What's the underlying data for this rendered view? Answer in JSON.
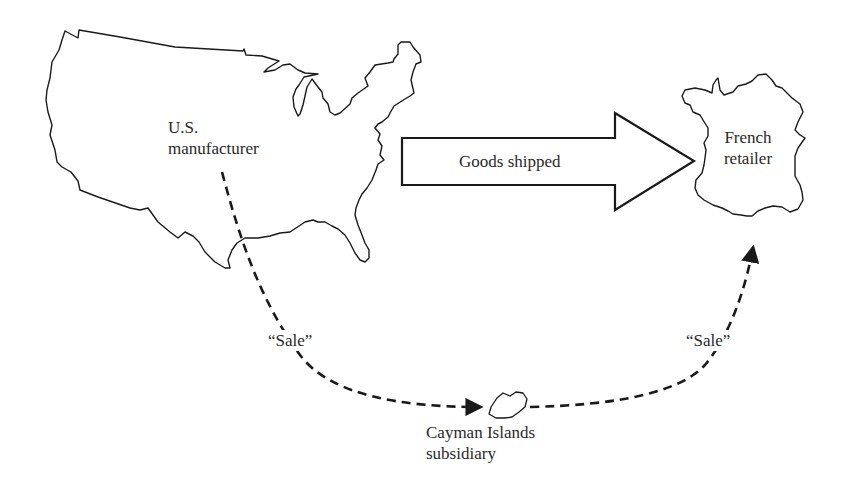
{
  "diagram": {
    "type": "flow",
    "nodes": [
      {
        "id": "us",
        "shape": "usa-map-outline",
        "label_lines": [
          "U.S.",
          "manufacturer"
        ]
      },
      {
        "id": "fr",
        "shape": "france-map-outline",
        "label_lines": [
          "French",
          "retailer"
        ]
      },
      {
        "id": "ky",
        "shape": "cayman-island-outline",
        "label_lines": [
          "Cayman Islands",
          "subsidiary"
        ]
      }
    ],
    "edges": [
      {
        "from": "us",
        "to": "fr",
        "style": "block-arrow",
        "label": "Goods shipped"
      },
      {
        "from": "us",
        "to": "ky",
        "style": "dashed-curve",
        "label": "“Sale”"
      },
      {
        "from": "ky",
        "to": "fr",
        "style": "dashed-curve",
        "label": "“Sale”"
      }
    ]
  },
  "labels": {
    "us_line1": "U.S.",
    "us_line2": "manufacturer",
    "fr_line1": "French",
    "fr_line2": "retailer",
    "ky_line1": "Cayman Islands",
    "ky_line2": "subsidiary",
    "goods_shipped": "Goods shipped",
    "sale_left": "“Sale”",
    "sale_right": "“Sale”"
  },
  "colors": {
    "stroke": "#1a1a1a",
    "text": "#2a2a2a",
    "background": "#ffffff"
  }
}
